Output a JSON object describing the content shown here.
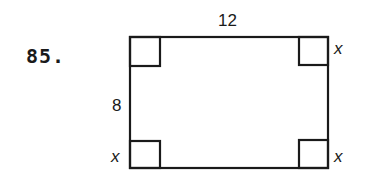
{
  "problem": {
    "number": "85."
  },
  "diagram": {
    "shape": "rectangle",
    "labels": {
      "top_length": "12",
      "left_width": "8",
      "corner_top_right": "x",
      "corner_bottom_left": "x",
      "corner_bottom_right": "x"
    },
    "dimensions": {
      "length": 12,
      "width": 8,
      "corner_square_side": "x"
    },
    "corner_squares": [
      "top-left",
      "top-right",
      "bottom-left",
      "bottom-right"
    ],
    "stroke_color": "#1a1a1a",
    "background_color": "#ffffff"
  }
}
